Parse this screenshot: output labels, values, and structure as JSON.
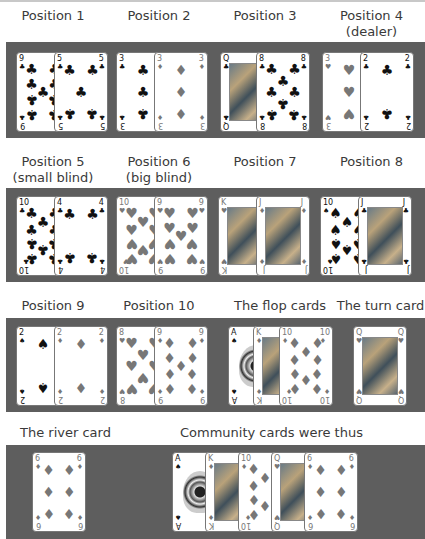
{
  "labels": {
    "p1": "Position 1",
    "p2": "Position 2",
    "p3": "Position 3",
    "p4a": "Position 4",
    "p4b": "(dealer)",
    "p5a": "Position 5",
    "p5b": "(small blind)",
    "p6a": "Position 6",
    "p6b": "(big blind)",
    "p7": "Position 7",
    "p8": "Position 8",
    "p9": "Position 9",
    "p10": "Position 10",
    "flop": "The flop cards",
    "turn": "The turn card",
    "river": "The river card",
    "community": "Community cards were thus"
  },
  "colors": {
    "band": "#5e5e5e",
    "card_bg": "#ffffff",
    "black_suit": "#111111",
    "red_suit_rendered": "#777777"
  },
  "hands": {
    "p1": [
      {
        "rank": "9",
        "suit": "♣"
      },
      {
        "rank": "5",
        "suit": "♣"
      }
    ],
    "p2": [
      {
        "rank": "3",
        "suit": "♣"
      },
      {
        "rank": "3",
        "suit": "♦"
      }
    ],
    "p3": [
      {
        "rank": "Q",
        "suit": "♣"
      },
      {
        "rank": "8",
        "suit": "♣"
      }
    ],
    "p4": [
      {
        "rank": "3",
        "suit": "♥"
      },
      {
        "rank": "2",
        "suit": "♣"
      }
    ],
    "p5": [
      {
        "rank": "10",
        "suit": "♣"
      },
      {
        "rank": "4",
        "suit": "♣"
      }
    ],
    "p6": [
      {
        "rank": "10",
        "suit": "♥"
      },
      {
        "rank": "9",
        "suit": "♥"
      }
    ],
    "p7": [
      {
        "rank": "K",
        "suit": "♥"
      },
      {
        "rank": "J",
        "suit": "♦"
      }
    ],
    "p8": [
      {
        "rank": "10",
        "suit": "♠"
      },
      {
        "rank": "J",
        "suit": "♣"
      }
    ],
    "p9": [
      {
        "rank": "2",
        "suit": "♠"
      },
      {
        "rank": "2",
        "suit": "♦"
      }
    ],
    "p10": [
      {
        "rank": "8",
        "suit": "♥"
      },
      {
        "rank": "9",
        "suit": "♦"
      }
    ],
    "flop": [
      {
        "rank": "A",
        "suit": "♠"
      },
      {
        "rank": "K",
        "suit": "♦"
      },
      {
        "rank": "10",
        "suit": "♦"
      }
    ],
    "turn": [
      {
        "rank": "Q",
        "suit": "♥"
      }
    ],
    "river": [
      {
        "rank": "6",
        "suit": "♦"
      }
    ],
    "community": [
      {
        "rank": "A",
        "suit": "♠"
      },
      {
        "rank": "K",
        "suit": "♦"
      },
      {
        "rank": "10",
        "suit": "♦"
      },
      {
        "rank": "Q",
        "suit": "♥"
      },
      {
        "rank": "6",
        "suit": "♦"
      }
    ]
  }
}
